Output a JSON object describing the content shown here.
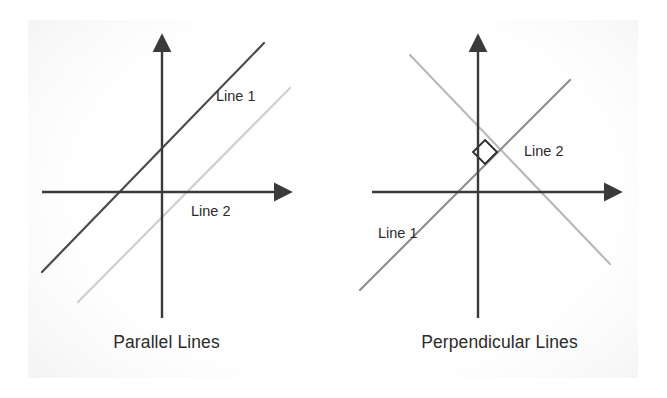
{
  "canvas": {
    "width": 667,
    "height": 398,
    "background": "#ffffff",
    "panel_background": "#f2f2f2"
  },
  "colors": {
    "axis": "#3a3a3a",
    "dark_line": "#4a4a4a",
    "light_line": "#cfcfcf",
    "mid_line": "#9a9a9a",
    "text": "#2b2b2b"
  },
  "figures": [
    {
      "id": "parallel",
      "caption": "Parallel Lines",
      "axes": {
        "x_axis_label": "",
        "y_axis_label": "",
        "origin_x": 162,
        "origin_y": 192
      },
      "lines": [
        {
          "label": "Line 1",
          "color": "#4a4a4a",
          "from": [
            42,
            272
          ],
          "to": [
            264,
            43
          ],
          "slope": 1.03
        },
        {
          "label": "Line 2",
          "color": "#cfcfcf",
          "from": [
            78,
            302
          ],
          "to": [
            290,
            88
          ],
          "slope": 1.01
        }
      ],
      "right_angle_marker": false
    },
    {
      "id": "perpendicular",
      "caption": "Perpendicular Lines",
      "axes": {
        "x_axis_label": "",
        "y_axis_label": "",
        "origin_x": 145,
        "origin_y": 192
      },
      "lines": [
        {
          "label": "Line 1",
          "color": "#8f8f8f",
          "from": [
            27,
            290
          ],
          "to": [
            237,
            80
          ],
          "slope": 1.0
        },
        {
          "label": "Line 2",
          "color": "#b9b9b9",
          "from": [
            77,
            55
          ],
          "to": [
            277,
            264
          ],
          "slope": -1.0
        }
      ],
      "right_angle_marker": true
    }
  ]
}
